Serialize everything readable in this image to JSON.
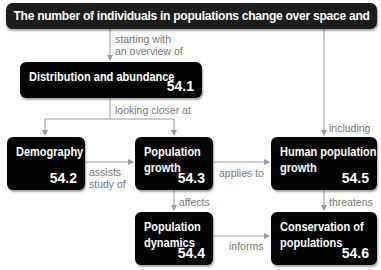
{
  "title": "The number of individuals in populations change over space and time",
  "nodes": [
    {
      "id": "distribution",
      "label": "Distribution and abundance",
      "number": "54.1"
    },
    {
      "id": "demography",
      "label": "Demography",
      "number": "54.2"
    },
    {
      "id": "population-growth",
      "label_line1": "Population",
      "label_line2": "growth",
      "number": "54.3"
    },
    {
      "id": "population-dynamics",
      "label_line1": "Population",
      "label_line2": "dynamics",
      "number": "54.4"
    },
    {
      "id": "human-population-growth",
      "label_line1": "Human population",
      "label_line2": "growth",
      "number": "54.5"
    },
    {
      "id": "conservation",
      "label_line1": "Conservation of",
      "label_line2": "populations",
      "number": "54.6"
    }
  ],
  "edges": {
    "starting_line1": "starting with",
    "starting_line2": "an overview of",
    "looking_closer": "looking closer at",
    "including": "including",
    "assists_line1": "assists",
    "assists_line2": "study of",
    "applies_to": "applies to",
    "affects": "affects",
    "threatens": "threatens",
    "informs": "informs"
  },
  "colors": {
    "box": "#050505",
    "line": "#9a9a9a",
    "edge_text": "#777777"
  }
}
